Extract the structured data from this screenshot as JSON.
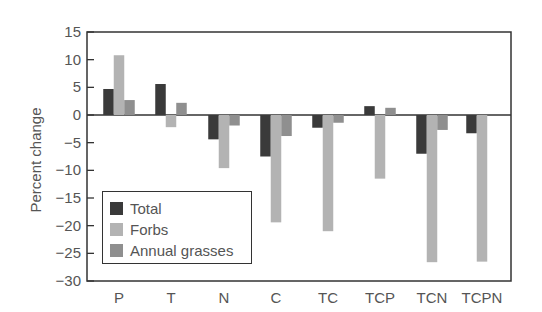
{
  "chart_data": {
    "type": "bar",
    "title": "",
    "xlabel": "",
    "ylabel": "Percent change",
    "ylim": [
      -30,
      15
    ],
    "yticks": [
      15,
      10,
      5,
      0,
      -5,
      -10,
      -15,
      -20,
      -25,
      -30
    ],
    "ytick_labels": [
      "15",
      "10",
      "5",
      "0",
      "−5",
      "−10",
      "−15",
      "−20",
      "−25",
      "−30"
    ],
    "grid": false,
    "legend_position": "lower left",
    "categories": [
      "P",
      "T",
      "N",
      "C",
      "TC",
      "TCP",
      "TCN",
      "TCPN"
    ],
    "series": [
      {
        "name": "Total",
        "color": "#3a3a3a",
        "values": [
          4.7,
          5.6,
          -4.4,
          -7.5,
          -2.3,
          1.6,
          -7.0,
          -3.3
        ]
      },
      {
        "name": "Forbs",
        "color": "#b3b3b3",
        "values": [
          10.8,
          -2.2,
          -9.6,
          -19.4,
          -21.0,
          -11.5,
          -26.6,
          -26.5
        ]
      },
      {
        "name": "Annual grasses",
        "color": "#8f8f8f",
        "values": [
          2.7,
          2.2,
          -1.9,
          -3.8,
          -1.4,
          1.3,
          -2.7,
          null
        ]
      }
    ]
  },
  "legend": {
    "items": [
      {
        "label": "Total",
        "color": "#3a3a3a"
      },
      {
        "label": "Forbs",
        "color": "#b3b3b3"
      },
      {
        "label": "Annual grasses",
        "color": "#8f8f8f"
      }
    ]
  }
}
